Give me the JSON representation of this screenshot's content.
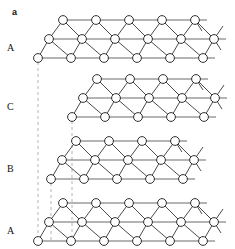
{
  "figure": {
    "panel_label": "a",
    "background_color": "#ffffff",
    "width": 235,
    "height": 249
  },
  "style": {
    "node_fill": "#ffffff",
    "node_stroke": "#1a1a1a",
    "node_radius": 4.4,
    "node_stroke_width": 0.9,
    "bond_color": "#2b2b2b",
    "bond_width": 0.85,
    "row_line_color": "#6b6b6b",
    "row_line_width": 1.1,
    "guide_color": "#b4b4b4",
    "guide_width": 1.0,
    "guide_dash": "3,3"
  },
  "layers": [
    {
      "id": "layer-a-top",
      "label": "A",
      "label_x": 7,
      "label_y": 48,
      "origin_x": 38,
      "origin_y": 58,
      "rows": [
        {
          "n": 6,
          "dx": 33.0,
          "x0": 0.0,
          "y": 0.0,
          "tail": 12
        },
        {
          "n": 6,
          "dx": 33.0,
          "x0": 11.0,
          "y": -19.0,
          "tail": 12
        },
        {
          "n": 5,
          "dx": 33.0,
          "x0": 25.0,
          "y": -38.0,
          "tail": 12
        }
      ]
    },
    {
      "id": "layer-c",
      "label": "C",
      "label_x": 7,
      "label_y": 107,
      "origin_x": 72,
      "origin_y": 117,
      "rows": [
        {
          "n": 5,
          "dx": 33.0,
          "x0": 0.0,
          "y": 0.0,
          "tail": 12
        },
        {
          "n": 5,
          "dx": 33.0,
          "x0": 11.0,
          "y": -19.0,
          "tail": 12
        },
        {
          "n": 4,
          "dx": 33.0,
          "x0": 25.0,
          "y": -38.0,
          "tail": 12
        }
      ]
    },
    {
      "id": "layer-b",
      "label": "B",
      "label_x": 7,
      "label_y": 169,
      "origin_x": 51,
      "origin_y": 179,
      "rows": [
        {
          "n": 5,
          "dx": 33.0,
          "x0": 0.0,
          "y": 0.0,
          "tail": 12
        },
        {
          "n": 5,
          "dx": 33.0,
          "x0": 11.0,
          "y": -19.0,
          "tail": 12
        },
        {
          "n": 4,
          "dx": 33.0,
          "x0": 25.0,
          "y": -38.0,
          "tail": 12
        }
      ]
    },
    {
      "id": "layer-a-bottom",
      "label": "A",
      "label_x": 7,
      "label_y": 231,
      "origin_x": 38,
      "origin_y": 241,
      "rows": [
        {
          "n": 6,
          "dx": 33.0,
          "x0": 0.0,
          "y": 0.0,
          "tail": 12
        },
        {
          "n": 6,
          "dx": 33.0,
          "x0": 11.0,
          "y": -19.0,
          "tail": 12
        },
        {
          "n": 5,
          "dx": 33.0,
          "x0": 25.0,
          "y": -38.0,
          "tail": 12
        }
      ]
    }
  ],
  "guides": [
    {
      "id": "guide-a",
      "x": 38,
      "y1": 62,
      "y2": 243
    },
    {
      "id": "guide-b",
      "x": 51,
      "y1": 183,
      "y2": 243
    },
    {
      "id": "guide-c",
      "x": 72,
      "y1": 121,
      "y2": 243
    }
  ]
}
